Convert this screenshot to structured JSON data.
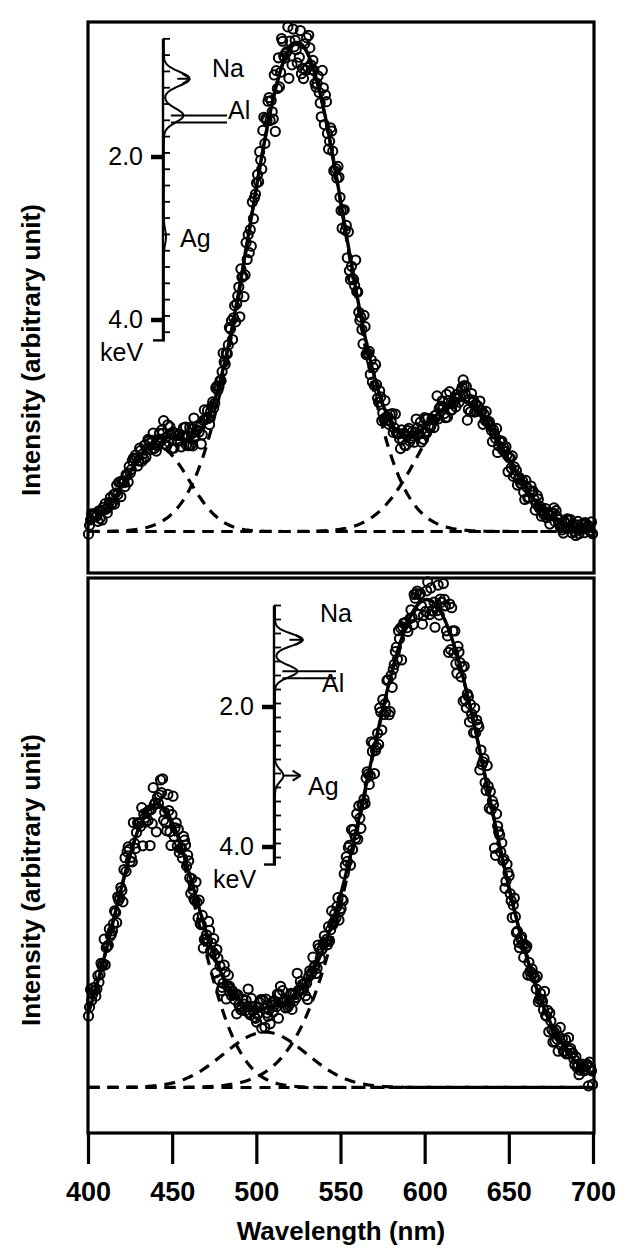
{
  "figure": {
    "x_axis_label": "Wavelength (nm)",
    "y_axis_label": "Intensity (arbitrary unit)",
    "x_tick_labels": [
      "400",
      "450",
      "500",
      "550",
      "600",
      "650",
      "700"
    ],
    "colors": {
      "ink": "#000000",
      "background": "#ffffff"
    }
  },
  "chart_data": [
    {
      "type": "line",
      "panel": "top",
      "title": "",
      "xlabel": "Wavelength (nm)",
      "ylabel": "Intensity (arbitrary unit)",
      "xlim": [
        400,
        700
      ],
      "ylim": [
        0,
        1.12
      ],
      "xticks": [
        400,
        450,
        500,
        550,
        600,
        650,
        700
      ],
      "yticks": [],
      "grid": false,
      "legend": "none",
      "series": [
        {
          "name": "measured data",
          "style": "open-circle-markers",
          "note": "densely overlapping open circles following the total fit"
        },
        {
          "name": "total fit",
          "style": "solid-line",
          "note": "sum of the three Gaussian components plus baseline"
        },
        {
          "name": "Gaussian component 1",
          "style": "dashed-line",
          "center": 441,
          "amplitude": 0.17,
          "fwhm": 44
        },
        {
          "name": "Gaussian component 2",
          "style": "dashed-line",
          "center": 524,
          "amplitude": 0.98,
          "fwhm": 68
        },
        {
          "name": "Gaussian component 3",
          "style": "dashed-line",
          "center": 622,
          "amplitude": 0.26,
          "fwhm": 60
        },
        {
          "name": "baseline",
          "style": "dashed-line",
          "value": 0.012
        }
      ],
      "peak_wavelengths_nm": [
        441,
        524,
        622
      ],
      "peak_relative_intensities": [
        0.17,
        0.98,
        0.26
      ]
    },
    {
      "type": "line",
      "panel": "bottom",
      "title": "",
      "xlabel": "Wavelength (nm)",
      "ylabel": "Intensity (arbitrary unit)",
      "xlim": [
        400,
        700
      ],
      "ylim": [
        0,
        1.12
      ],
      "xticks": [
        400,
        450,
        500,
        550,
        600,
        650,
        700
      ],
      "yticks": [],
      "grid": false,
      "legend": "none",
      "series": [
        {
          "name": "measured data",
          "style": "open-circle-markers",
          "note": "densely overlapping open circles following the total fit"
        },
        {
          "name": "total fit",
          "style": "solid-line",
          "note": "sum of the three Gaussian components plus baseline"
        },
        {
          "name": "Gaussian component 1",
          "style": "dashed-line",
          "center": 440,
          "amplitude": 0.56,
          "fwhm": 58
        },
        {
          "name": "Gaussian component 2",
          "style": "dashed-line",
          "center": 505,
          "amplitude": 0.11,
          "fwhm": 58
        },
        {
          "name": "Gaussian component 3",
          "style": "dashed-line",
          "center": 601,
          "amplitude": 0.97,
          "fwhm": 86
        },
        {
          "name": "baseline",
          "style": "dashed-line",
          "value": 0.02
        }
      ],
      "peak_wavelengths_nm": [
        440,
        505,
        601
      ],
      "peak_relative_intensities": [
        0.56,
        0.11,
        0.97
      ]
    }
  ],
  "insets": {
    "top": {
      "type": "EDX spectrum",
      "axis_unit": "keV",
      "axis_tick_labels": [
        "2.0",
        "4.0"
      ],
      "unit_label": "keV",
      "peak_labels": [
        "Na",
        "Al",
        "Ag"
      ],
      "peaks": [
        {
          "element": "Na",
          "energy_keV": 1.04,
          "relative_height": 1.0,
          "annotation": "arrow"
        },
        {
          "element": "Al",
          "energy_keV": 1.49,
          "relative_height": 0.75,
          "annotation": "leader-line"
        },
        {
          "element": "Ag",
          "energy_keV": 2.98,
          "relative_height": 0.08,
          "annotation": "label"
        }
      ]
    },
    "bottom": {
      "type": "EDX spectrum",
      "axis_unit": "keV",
      "axis_tick_labels": [
        "2.0",
        "4.0"
      ],
      "unit_label": "keV",
      "peak_labels": [
        "Na",
        "Al",
        "Ag"
      ],
      "peaks": [
        {
          "element": "Na",
          "energy_keV": 1.04,
          "relative_height": 1.0,
          "annotation": "arrow"
        },
        {
          "element": "Al",
          "energy_keV": 1.49,
          "relative_height": 0.8,
          "annotation": "leader-line"
        },
        {
          "element": "Ag",
          "energy_keV": 2.98,
          "relative_height": 0.3,
          "annotation": "arrow"
        }
      ]
    }
  }
}
